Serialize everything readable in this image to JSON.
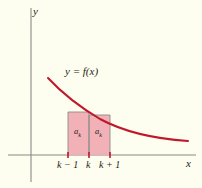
{
  "figure": {
    "background_color": "#fdfdf0",
    "curve_color": "#c0182b",
    "rect_fill_color": "#f0adb2",
    "axis_color": "#8a8a86"
  },
  "axes": {
    "y_label": "y",
    "x_label": "x",
    "origin": {
      "x": 31,
      "y": 155
    }
  },
  "curve": {
    "label": "y = f(x)",
    "label_text_plain": "y = f(x)",
    "path": "M 48,78 C 62,93 78,106 100,119 C 126,133 158,139 188,141",
    "description": "decreasing convex curve"
  },
  "rectangles": [
    {
      "name": "left-rectangle",
      "label": "a",
      "subscript": "k",
      "x_start": 68,
      "x_end": 89,
      "top": 112,
      "bottom": 155
    },
    {
      "name": "right-rectangle",
      "label": "a",
      "subscript": "k",
      "x_start": 89,
      "x_end": 110,
      "top": 115,
      "bottom": 155
    }
  ],
  "x_ticks": [
    {
      "name": "tick-k-minus-1",
      "label": "k − 1",
      "x": 68
    },
    {
      "name": "tick-k",
      "label": "k",
      "x": 89
    },
    {
      "name": "tick-k-plus-1",
      "label": "k + 1",
      "x": 110
    }
  ]
}
